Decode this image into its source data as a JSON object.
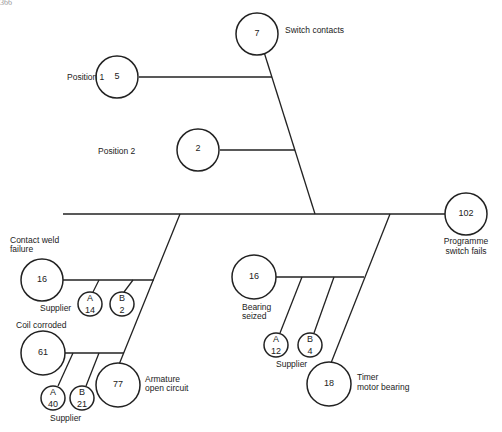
{
  "header": {
    "page_fragment": "366",
    "title_fragment": "...g... ...y"
  },
  "diagram": {
    "root": {
      "label": "Programme switch fails",
      "label_line1": "Programme",
      "label_line2": "switch fails",
      "count": "102"
    },
    "switch_contacts": {
      "label": "Switch contacts",
      "count": "7"
    },
    "position_1": {
      "label": "Position 1",
      "count": "5"
    },
    "position_2": {
      "label": "Position 2",
      "count": "2"
    },
    "contact_weld": {
      "label_line1": "Contact weld",
      "label_line2": "failure",
      "count": "16",
      "supplier_label": "Supplier",
      "supplier_a": {
        "letter": "A",
        "count": "14"
      },
      "supplier_b": {
        "letter": "B",
        "count": "2"
      }
    },
    "coil_corroded": {
      "label": "Coil corroded",
      "count": "61",
      "supplier_label": "Supplier",
      "supplier_a": {
        "letter": "A",
        "count": "40"
      },
      "supplier_b": {
        "letter": "B",
        "count": "21"
      }
    },
    "armature": {
      "label_line1": "Armature",
      "label_line2": "open circuit",
      "count": "77"
    },
    "bearing_seized": {
      "label_line1": "Bearing",
      "label_line2": "seized",
      "count": "16",
      "supplier_label": "Supplier",
      "supplier_a": {
        "letter": "A",
        "count": "12"
      },
      "supplier_b": {
        "letter": "B",
        "count": "4"
      }
    },
    "timer_bearing": {
      "label_line1": "Timer",
      "label_line2": "motor bearing",
      "count": "18"
    }
  }
}
